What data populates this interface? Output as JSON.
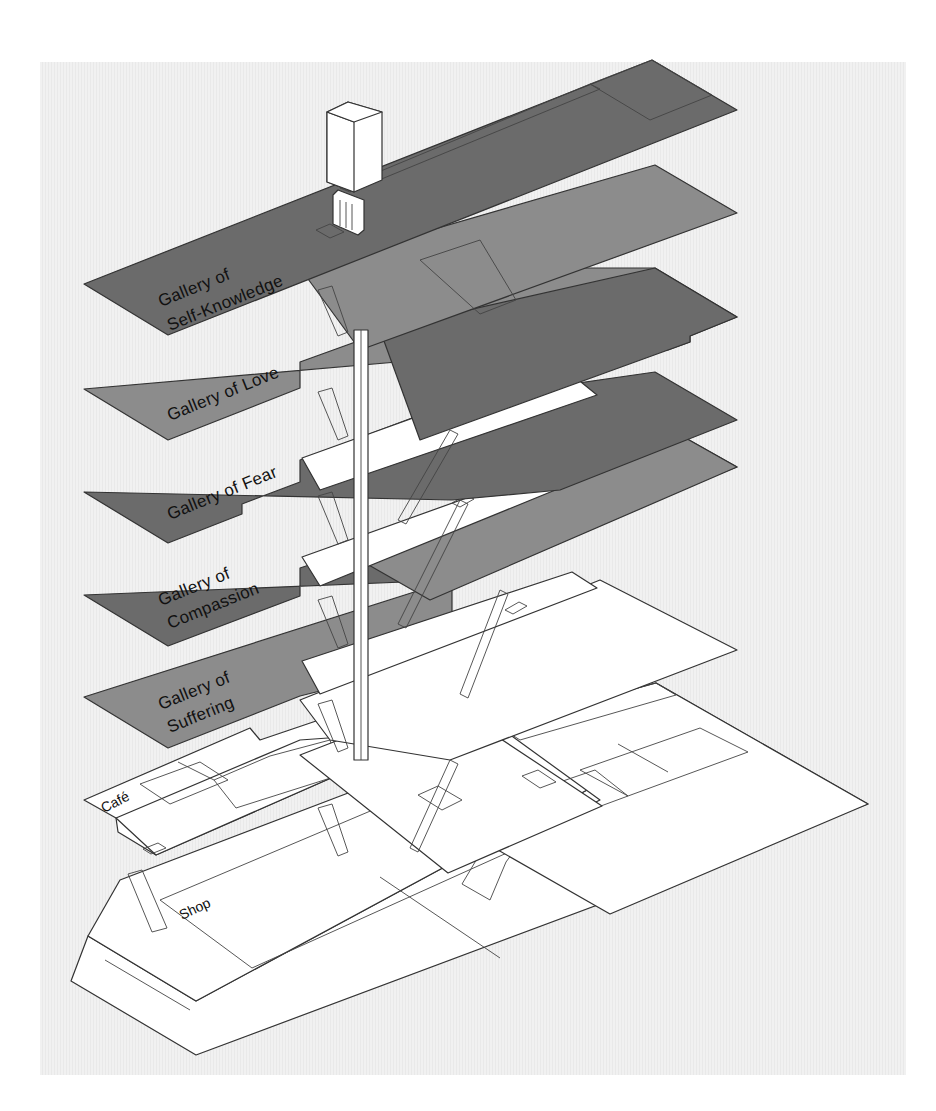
{
  "diagram": {
    "type": "exploded axonometric floor plan",
    "background": "#efefef",
    "colors": {
      "dark_gallery": "#6b6b6b",
      "mid_gallery": "#8c8c8c",
      "light_inset": "#d4d4d4",
      "white_slab": "#ffffff",
      "hatch_gray": "#d9d9d9",
      "outline": "#333333"
    },
    "floors": [
      {
        "id": "self-knowledge",
        "label_line1": "Gallery of",
        "label_line2": "Self-Knowledge",
        "fill": "dark"
      },
      {
        "id": "love",
        "label_line1": "Gallery of Love",
        "label_line2": "",
        "fill": "mid"
      },
      {
        "id": "fear",
        "label_line1": "Gallery of Fear",
        "label_line2": "",
        "fill": "dark"
      },
      {
        "id": "compassion",
        "label_line1": "Gallery of",
        "label_line2": "Compassion",
        "fill": "dark"
      },
      {
        "id": "suffering",
        "label_line1": "Gallery of",
        "label_line2": "Suffering",
        "fill": "mid"
      }
    ],
    "lower_levels": {
      "cafe": {
        "label": "Café"
      },
      "shop": {
        "label": "Shop"
      }
    }
  }
}
